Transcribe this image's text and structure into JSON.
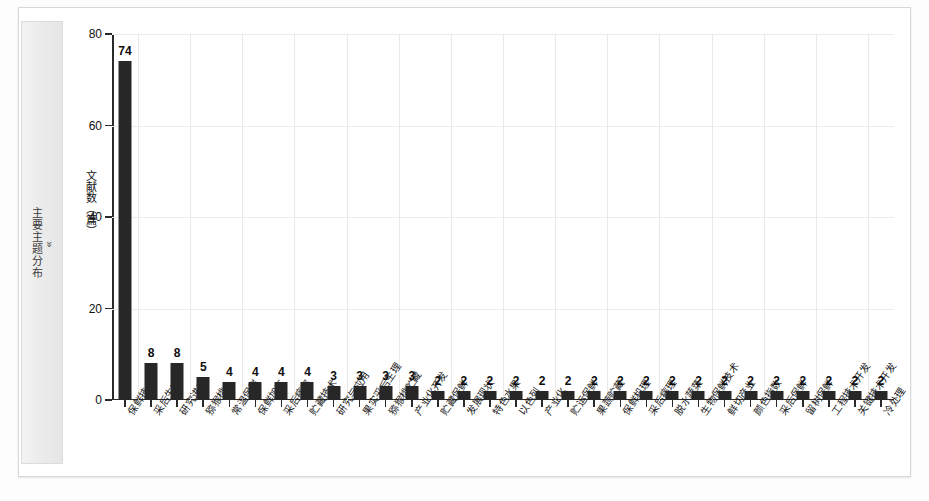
{
  "sidebar": {
    "label": "主要主题分布",
    "chevron": "»",
    "chevron_icon": "double-chevron-right-icon"
  },
  "chart_data": {
    "type": "bar",
    "title": "",
    "xlabel": "",
    "ylabel": "文献数（篇）",
    "ylim": [
      0,
      80
    ],
    "yticks": [
      0,
      20,
      40,
      60,
      80
    ],
    "grid": true,
    "legend": "none",
    "bar_color": "#272727",
    "categories": [
      "保鲜技术",
      "采后生理",
      "研究进展",
      "猕猴桃",
      "常温保鲜",
      "保鲜加工",
      "采后病害",
      "贮藏技术",
      "研究与应用",
      "果实采后生理",
      "猕猴桃贮藏",
      "产业化开发",
      "贮藏保鲜",
      "发展现状",
      "特色水果",
      "以色列",
      "产业化",
      "贮运保鲜",
      "果蔬贮藏",
      "保鲜机理",
      "采后病理",
      "脱水蔬菜",
      "生物保鲜技术",
      "鲜切产业",
      "颜色指数",
      "采后保鲜",
      "留树保鲜",
      "工程技术开发",
      "关键技术开发",
      "冷处理"
    ],
    "values": [
      74,
      8,
      8,
      5,
      4,
      4,
      4,
      4,
      3,
      3,
      3,
      3,
      2,
      2,
      2,
      2,
      2,
      2,
      2,
      2,
      2,
      2,
      2,
      2,
      2,
      2,
      2,
      2,
      2,
      2
    ]
  }
}
